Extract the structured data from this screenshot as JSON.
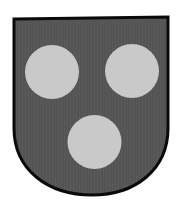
{
  "emblem": {
    "type": "coat-of-arms",
    "shield": {
      "field_color": "#545454",
      "border_color": "#0a0a0a",
      "texture_color": "#5c5c5c"
    },
    "charges": {
      "name": "three roundels",
      "arrangement": "2 and 1",
      "color": "#c9c9c9",
      "items": [
        {
          "cx": 52,
          "cy": 72,
          "r": 27
        },
        {
          "cx": 132,
          "cy": 71,
          "r": 27
        },
        {
          "cx": 94.5,
          "cy": 142,
          "r": 27
        }
      ]
    }
  }
}
